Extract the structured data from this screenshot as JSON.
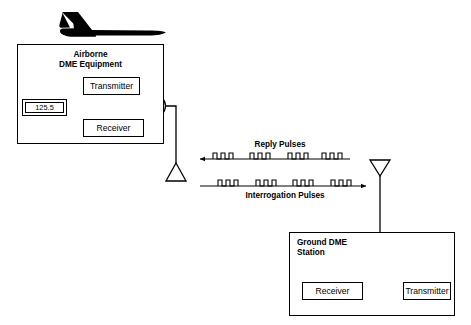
{
  "diagram": {
    "title_hidden": "DME Distance Measuring Equipment operation",
    "aircraft": {
      "icon": "airplane-silhouette"
    },
    "airborne_unit": {
      "title_line1": "Airborne",
      "title_line2": "DME Equipment",
      "transmitter_label": "Transmitter",
      "receiver_label": "Receiver",
      "frequency_display_value": "125.5",
      "antenna_icon": "triangle-antenna-up",
      "coupler_icon": "circle-coupler"
    },
    "ground_unit": {
      "title_line1": "Ground DME",
      "title_line2": "Station",
      "receiver_label": "Receiver",
      "transmitter_label": "Transmitter",
      "antenna_icon": "triangle-antenna-down",
      "coupler_icon": "circle-coupler"
    },
    "signals": {
      "reply_label": "Reply Pulses",
      "interrogation_label": "Interrogation Pulses",
      "reply_direction": "right-to-left",
      "interrogation_direction": "left-to-right",
      "pulse_groups": 4,
      "pulses_per_group": 3
    },
    "colors": {
      "stroke": "#000000",
      "background": "#ffffff",
      "aircraft_fill": "#000000"
    }
  }
}
